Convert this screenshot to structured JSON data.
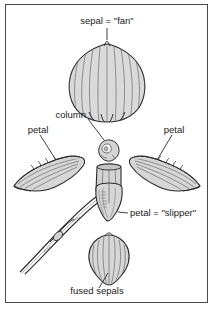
{
  "figure": {
    "background_color": "#ffffff",
    "frame_color": "#4a4a4a",
    "ink_color": "#2b2b2b",
    "fill_color": "#d8d8d8",
    "shade_color": "#bdbdbd",
    "line_color": "#5c5c5c"
  },
  "labels": {
    "dorsal_sepal": "sepal = \"fan\"",
    "column": "column",
    "petal_left": "petal",
    "petal_right": "petal",
    "lip": "petal = \"slipper\"",
    "fused_sepals": "fused sepals"
  },
  "parts": [
    {
      "id": "dorsal-sepal",
      "name": "dorsal sepal",
      "label": "sepal = \"fan\"",
      "description": "large rounded fan-shaped sepal with vertical ribbing"
    },
    {
      "id": "column",
      "name": "column",
      "label": "column",
      "description": "small irregular central reproductive structure"
    },
    {
      "id": "petal-left",
      "name": "left lateral petal",
      "label": "petal",
      "description": "elongated tapering petal with wavy hairy margin"
    },
    {
      "id": "petal-right",
      "name": "right lateral petal",
      "label": "petal",
      "description": "elongated tapering petal, mirror of left petal"
    },
    {
      "id": "lip",
      "name": "lip petal",
      "label": "petal = \"slipper\"",
      "description": "pouch-shaped slipper petal on curving stem"
    },
    {
      "id": "fused-sepals",
      "name": "fused lateral sepals",
      "label": "fused sepals",
      "description": "heart-shaped ribbed synsepal pointing downward"
    }
  ]
}
